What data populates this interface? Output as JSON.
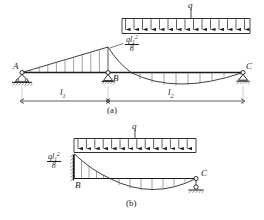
{
  "figure": {
    "panels": [
      {
        "id": "a",
        "caption": "(a)",
        "nodes": [
          {
            "name": "A",
            "label": "A",
            "support": "pin"
          },
          {
            "name": "B",
            "label": "B",
            "support": "pin"
          },
          {
            "name": "C",
            "label": "C",
            "support": "roller"
          }
        ],
        "load": {
          "symbol": "q",
          "type": "uniformly-distributed",
          "span": "l2"
        },
        "moment_label": {
          "numerator": "ql",
          "numerator_sub": "1",
          "numerator_sup": "2",
          "denominator": "8"
        },
        "dimensions": [
          {
            "label": "l",
            "sub": "1"
          },
          {
            "label": "l",
            "sub": "2"
          }
        ]
      },
      {
        "id": "b",
        "caption": "(b)",
        "nodes": [
          {
            "name": "B",
            "label": "B",
            "support": "fixed"
          },
          {
            "name": "C",
            "label": "C",
            "support": "roller"
          }
        ],
        "load": {
          "symbol": "q",
          "type": "uniformly-distributed",
          "span": "BC"
        },
        "moment_label": {
          "numerator": "ql",
          "numerator_sub": "1",
          "numerator_sup": "2",
          "denominator": "8"
        }
      }
    ],
    "colors": {
      "line": "#1a1a1a",
      "diagram": "#2a2a2a",
      "background": "#ffffff",
      "hatch": "#555555"
    }
  }
}
